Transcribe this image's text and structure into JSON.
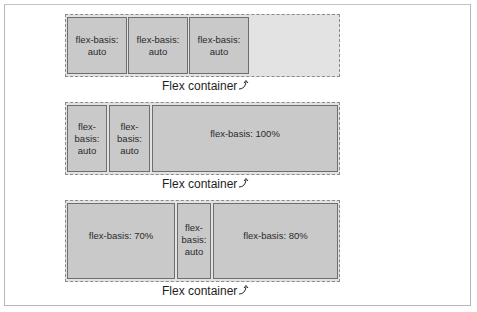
{
  "diagrams": [
    {
      "caption": "Flex container",
      "items": [
        {
          "label": "flex-basis: auto"
        },
        {
          "label": "flex-basis: auto"
        },
        {
          "label": "flex-basis: auto"
        }
      ]
    },
    {
      "caption": "Flex container",
      "items": [
        {
          "label": "flex-basis: auto"
        },
        {
          "label": "flex-basis: auto"
        },
        {
          "label": "flex-basis: 100%"
        }
      ]
    },
    {
      "caption": "Flex container",
      "items": [
        {
          "label": "flex-basis: 70%"
        },
        {
          "label": "flex-basis: auto"
        },
        {
          "label": "flex-basis: 80%"
        }
      ]
    }
  ],
  "icons": {
    "caption_arrow": "curved-arrow-up-right-icon"
  },
  "colors": {
    "container_fill": "#e3e3e3",
    "item_fill": "#c9c9c9",
    "item_border": "#6e6e6e",
    "dashed_border": "#8a8a8a"
  }
}
